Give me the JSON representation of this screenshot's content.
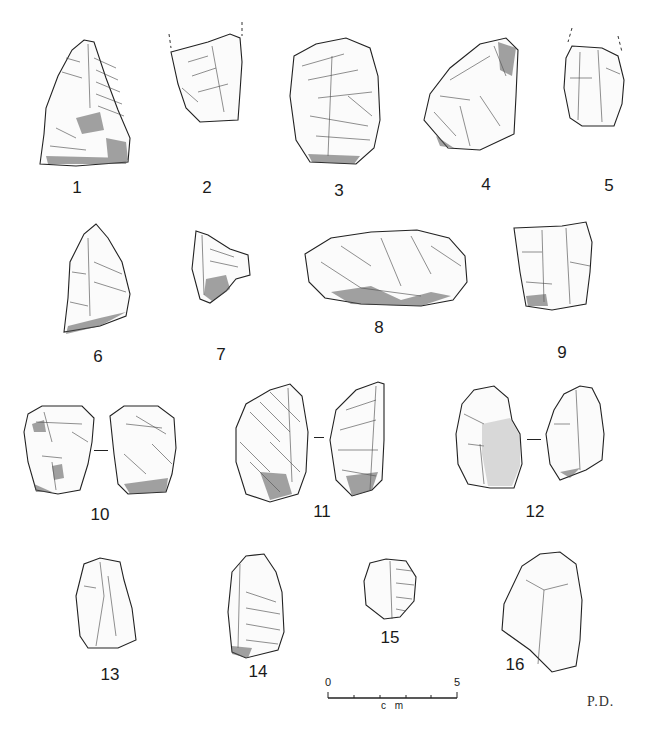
{
  "plate": {
    "title": "Lithic artifacts plate",
    "artifacts": [
      {
        "id": "1",
        "label": "1"
      },
      {
        "id": "2",
        "label": "2"
      },
      {
        "id": "3",
        "label": "3"
      },
      {
        "id": "4",
        "label": "4"
      },
      {
        "id": "5",
        "label": "5"
      },
      {
        "id": "6",
        "label": "6"
      },
      {
        "id": "7",
        "label": "7"
      },
      {
        "id": "8",
        "label": "8"
      },
      {
        "id": "9",
        "label": "9"
      },
      {
        "id": "10",
        "label": "10"
      },
      {
        "id": "11",
        "label": "11"
      },
      {
        "id": "12",
        "label": "12"
      },
      {
        "id": "13",
        "label": "13"
      },
      {
        "id": "14",
        "label": "14"
      },
      {
        "id": "15",
        "label": "15"
      },
      {
        "id": "16",
        "label": "16"
      }
    ],
    "scale_bar": {
      "start_label": "0",
      "end_label": "5",
      "unit": "c m",
      "ticks": 6
    },
    "illustrator_initials": "P.D.",
    "colors": {
      "ink": "#1a1a1a",
      "background": "#ffffff"
    }
  }
}
